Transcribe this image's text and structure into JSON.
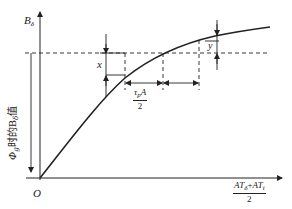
{
  "diagram": {
    "type": "magnetization-curve-construction",
    "y_axis_label": "B",
    "y_axis_label_sub": "δ",
    "origin_label": "O",
    "x_axis_label": {
      "numerator_a": "AT",
      "numerator_a_sub": "δ",
      "plus": "+",
      "numerator_b": "AT",
      "numerator_b_sub": "t",
      "denominator": "2"
    },
    "vertical_annotation": {
      "prefix": "Φ",
      "prefix_sub": "g",
      "middle": "时的B",
      "middle_sub": "δ",
      "suffix": "值"
    },
    "dimension_x_label": "x",
    "dimension_y_label": "y",
    "span_label": {
      "numerator": "τ",
      "numerator_sub": "p",
      "numerator_tail": "A",
      "denominator": "2"
    },
    "colors": {
      "line": "#222222",
      "background": "#ffffff"
    }
  }
}
